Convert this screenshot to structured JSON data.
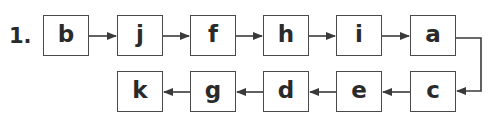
{
  "problem": {
    "number": "1.",
    "top_row": [
      "b",
      "j",
      "f",
      "h",
      "i",
      "a"
    ],
    "bottom_row_left_to_right": [
      "k",
      "g",
      "d",
      "e",
      "c"
    ],
    "sequence": [
      "b",
      "j",
      "f",
      "h",
      "i",
      "a",
      "c",
      "e",
      "d",
      "g",
      "k"
    ]
  },
  "colors": {
    "line": "#3a3a3a",
    "text": "#2a2a2a"
  }
}
